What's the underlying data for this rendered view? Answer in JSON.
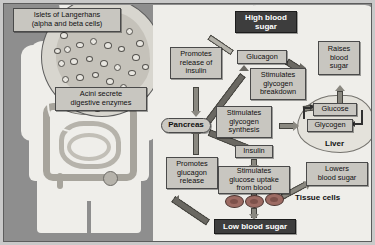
{
  "diagram": {
    "colors": {
      "background": "#8e8e8e",
      "panel": "#efeeea",
      "box_fill": "#c8c6c0",
      "emphasis_fill": "#3d3d3d",
      "emphasis_text": "#ffffff",
      "arrow": "#8a8880",
      "cell": "#9d6b63"
    },
    "left_panel": {
      "callouts": [
        {
          "id": "islets",
          "label": "Islets of Langerhans\n(alpha and beta cells)"
        },
        {
          "id": "acini",
          "label": "Acini secrete\ndigestive enzymes"
        }
      ],
      "islets_line1": "Islets of Langerhans",
      "islets_line2": "(alpha and beta cells)",
      "acini_line1": "Acini secrete",
      "acini_line2": "digestive enzymes"
    },
    "nodes": {
      "high_blood_sugar": {
        "line1": "High blood",
        "line2": "sugar",
        "style": "dark"
      },
      "low_blood_sugar": {
        "line1": "Low blood sugar",
        "style": "dark"
      },
      "promotes_insulin": {
        "line1": "Promotes",
        "line2": "release of",
        "line3": "insulin"
      },
      "promotes_glucagon": {
        "line1": "Promotes",
        "line2": "glucagon",
        "line3": "release"
      },
      "pancreas": {
        "label": "Pancreas",
        "style": "oval"
      },
      "glucagon": {
        "label": "Glucagon"
      },
      "insulin": {
        "label": "Insulin"
      },
      "stim_breakdown": {
        "line1": "Stimulates",
        "line2": "glycogen",
        "line3": "breakdown"
      },
      "stim_synthesis": {
        "line1": "Stimulates",
        "line2": "glycogen",
        "line3": "synthesis"
      },
      "stim_uptake": {
        "line1": "Stimulates",
        "line2": "glucose uptake",
        "line3": "from blood"
      },
      "raises_blood_sugar": {
        "line1": "Raises",
        "line2": "blood",
        "line3": "sugar"
      },
      "lowers_blood_sugar": {
        "line1": "Lowers",
        "line2": "blood sugar"
      },
      "glucose": {
        "label": "Glucose"
      },
      "glycogen": {
        "label": "Glycogen"
      },
      "liver": {
        "label": "Liver"
      },
      "tissue_cells": {
        "label": "Tissue cells"
      }
    },
    "edges": [
      {
        "from": "high_blood_sugar",
        "to": "promotes_glucagon_path",
        "note": "high sugar leads to insulin release"
      },
      {
        "from": "promotes_insulin",
        "to": "pancreas"
      },
      {
        "from": "pancreas",
        "to": "glucagon"
      },
      {
        "from": "glucagon",
        "to": "stim_breakdown"
      },
      {
        "from": "stim_breakdown",
        "to": "glucose"
      },
      {
        "from": "glucose",
        "to": "raises_blood_sugar"
      },
      {
        "from": "glycogen",
        "to": "glucose",
        "note": "glycogen breakdown"
      },
      {
        "from": "glucose",
        "to": "glycogen",
        "note": "glycogen synthesis"
      },
      {
        "from": "pancreas",
        "to": "insulin"
      },
      {
        "from": "stim_synthesis",
        "to": "glycogen"
      },
      {
        "from": "insulin",
        "to": "stim_uptake"
      },
      {
        "from": "stim_uptake",
        "to": "tissue_cells"
      },
      {
        "from": "tissue_cells",
        "to": "lowers_blood_sugar"
      },
      {
        "from": "stim_uptake",
        "to": "low_blood_sugar"
      },
      {
        "from": "low_blood_sugar",
        "to": "promotes_glucagon"
      },
      {
        "from": "promotes_glucagon",
        "to": "pancreas"
      }
    ]
  }
}
